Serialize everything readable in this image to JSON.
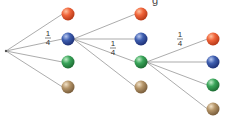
{
  "diagram": {
    "type": "probability-tree",
    "title_fragment": "g",
    "outcomes": [
      "orange",
      "blue",
      "green",
      "tan"
    ],
    "colors": {
      "orange": "#f0643a",
      "blue": "#3f5fb0",
      "green": "#3aa55a",
      "tan": "#b49468",
      "line": "#888888"
    },
    "levels": [
      {
        "parent": "root",
        "branch_probability_label": {
          "numerator": "1",
          "denominator": "4"
        },
        "labeled_branch": "blue",
        "children": [
          "orange",
          "blue",
          "green",
          "tan"
        ]
      },
      {
        "parent": "blue",
        "branch_probability_label": {
          "numerator": "1",
          "denominator": "4"
        },
        "labeled_branch": "green",
        "children": [
          "orange",
          "blue",
          "green",
          "tan"
        ]
      },
      {
        "parent": "green",
        "branch_probability_label": {
          "numerator": "1",
          "denominator": "4"
        },
        "labeled_branch": "orange",
        "children": [
          "orange",
          "blue",
          "green",
          "tan"
        ]
      }
    ]
  }
}
